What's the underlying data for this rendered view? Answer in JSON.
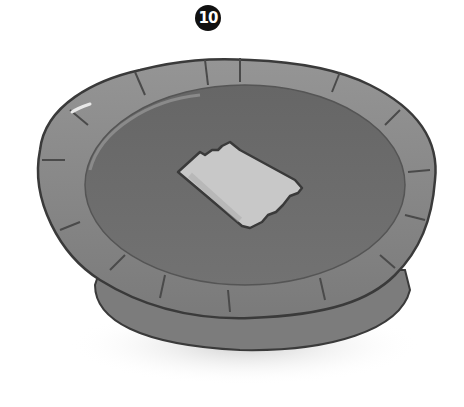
{
  "step": {
    "number": "10"
  },
  "illustration": {
    "subject": "pie-with-pastry-square",
    "description": "Grayscale illustration of a pie in a crimped crust with a small square of pastry placed in the center",
    "colors": {
      "crust": "#8a8a8a",
      "crust_dark": "#5e5e5e",
      "filling": "#6e6e6e",
      "pastry_square": "#c8c8c8",
      "outline": "#3a3a3a",
      "shadow": "#d8d8d8"
    }
  }
}
